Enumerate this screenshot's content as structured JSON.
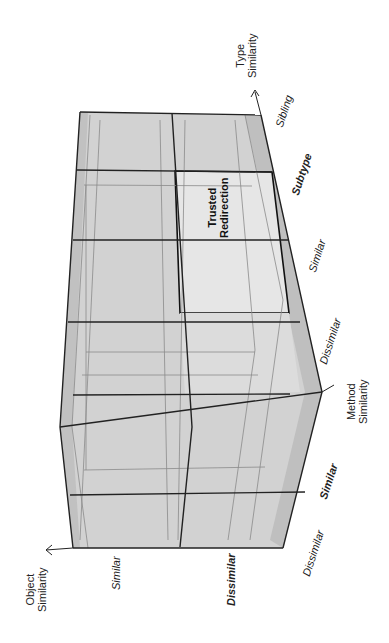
{
  "diagram": {
    "type": "3d-grid-cube",
    "orientation": "rotated-90-ccw",
    "fill_colors": {
      "face": "#cfcfcf",
      "face_light": "#dedede",
      "highlight": "#e8e8e8",
      "edge": "#222222",
      "thin_edge": "#8a8a8a"
    },
    "axes": {
      "object": {
        "title_line1": "Object",
        "title_line2": "Similarity",
        "ticks": [
          {
            "label": "Similar",
            "style": "italic"
          },
          {
            "label": "Dissimilar",
            "style": "bold-italic"
          }
        ]
      },
      "method": {
        "title_line1": "Method",
        "title_line2": "Similarity",
        "ticks": [
          {
            "label": "Dissimilar",
            "style": "italic"
          },
          {
            "label": "Similar",
            "style": "bold-italic"
          }
        ]
      },
      "type": {
        "title_line1": "Type",
        "title_line2": "Similarity",
        "ticks": [
          {
            "label": "Dissimilar",
            "style": "italic"
          },
          {
            "label": "Similar",
            "style": "italic"
          },
          {
            "label": "Subtype",
            "style": "bold-italic"
          },
          {
            "label": "Sibling",
            "style": "italic"
          }
        ]
      }
    },
    "highlighted_cell": {
      "line1": "Trusted",
      "line2": "Redirection",
      "coordinates": {
        "object": "Dissimilar",
        "method": "Similar",
        "type": "Subtype"
      }
    }
  }
}
